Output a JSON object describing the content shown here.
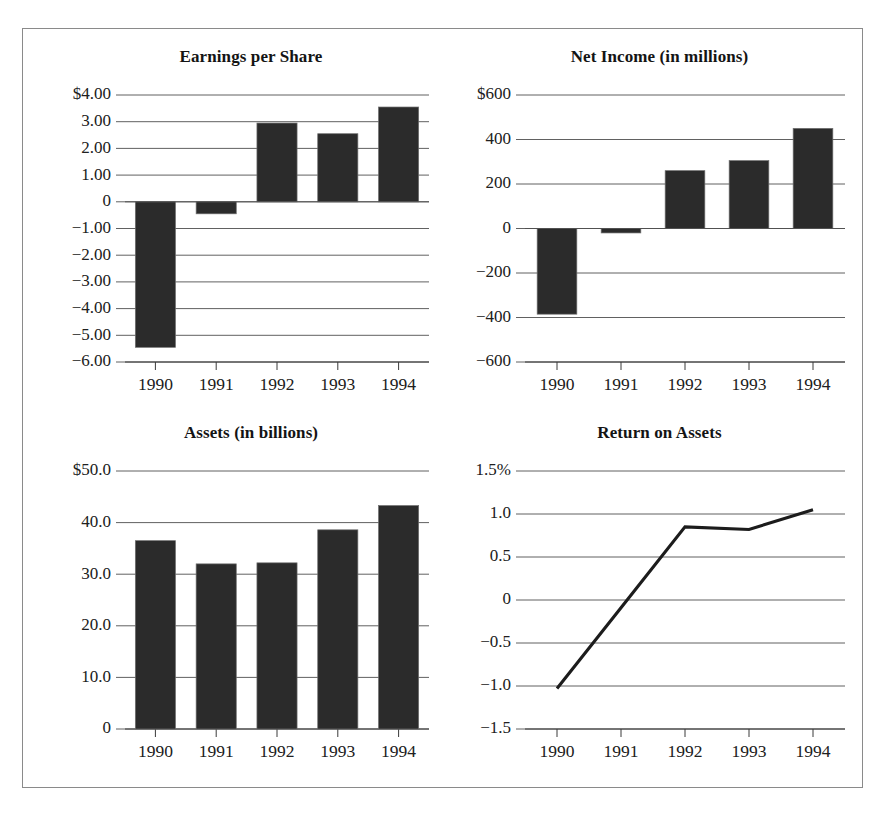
{
  "figure": {
    "background_color": "#ffffff",
    "frame_color": "#8a8a8a",
    "bar_color": "#2b2b2b",
    "line_color": "#1c1c1c",
    "grid_color": "#4f4f4f"
  },
  "chart_data": [
    {
      "type": "bar",
      "title": "Earnings per Share",
      "xlabel": "",
      "ylabel": "",
      "categories": [
        "1990",
        "1991",
        "1992",
        "1993",
        "1994"
      ],
      "values": [
        -5.45,
        -0.45,
        2.95,
        2.55,
        3.55
      ],
      "ylim": [
        -6.0,
        4.0
      ],
      "yticks": [
        4.0,
        3.0,
        2.0,
        1.0,
        0,
        -1.0,
        -2.0,
        -3.0,
        -4.0,
        -5.0,
        -6.0
      ],
      "ytick_labels": [
        "$4.00",
        "3.00",
        "2.00",
        "1.00",
        "0",
        "−1.00",
        "−2.00",
        "−3.00",
        "−4.00",
        "−5.00",
        "−6.00"
      ],
      "grid": true,
      "legend": "none"
    },
    {
      "type": "bar",
      "title": "Net Income (in millions)",
      "xlabel": "",
      "ylabel": "",
      "categories": [
        "1990",
        "1991",
        "1992",
        "1993",
        "1994"
      ],
      "values": [
        -385,
        -20,
        260,
        305,
        450
      ],
      "ylim": [
        -600,
        600
      ],
      "yticks": [
        600,
        400,
        200,
        0,
        -200,
        -400,
        -600
      ],
      "ytick_labels": [
        "$600",
        "400",
        "200",
        "0",
        "−200",
        "−400",
        "−600"
      ],
      "grid": true,
      "legend": "none"
    },
    {
      "type": "bar",
      "title": "Assets (in billions)",
      "xlabel": "",
      "ylabel": "",
      "categories": [
        "1990",
        "1991",
        "1992",
        "1993",
        "1994"
      ],
      "values": [
        36.5,
        32.0,
        32.2,
        38.6,
        43.3
      ],
      "ylim": [
        0,
        50.0
      ],
      "yticks": [
        50.0,
        40.0,
        30.0,
        20.0,
        10.0,
        0
      ],
      "ytick_labels": [
        "$50.0",
        "40.0",
        "30.0",
        "20.0",
        "10.0",
        "0"
      ],
      "grid": true,
      "legend": "none"
    },
    {
      "type": "line",
      "title": "Return on Assets",
      "xlabel": "",
      "ylabel": "",
      "x": [
        "1990",
        "1991",
        "1992",
        "1993",
        "1994"
      ],
      "values": [
        -1.03,
        -0.09,
        0.85,
        0.82,
        1.05
      ],
      "ylim": [
        -1.5,
        1.5
      ],
      "yticks": [
        1.5,
        1.0,
        0.5,
        0,
        -0.5,
        -1.0,
        -1.5
      ],
      "ytick_labels": [
        "1.5%",
        "1.0",
        "0.5",
        "0",
        "−0.5",
        "−1.0",
        "−1.5"
      ],
      "grid": true,
      "legend": "none"
    }
  ]
}
